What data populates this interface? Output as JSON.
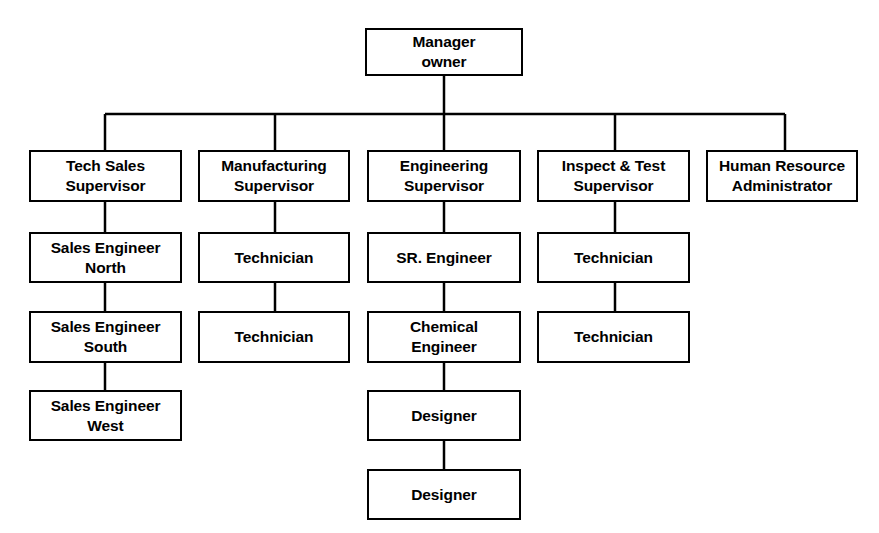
{
  "chart_data": {
    "type": "diagram",
    "diagram_type": "organizational-chart",
    "orientation": "top-down",
    "style": {
      "box_fill": "#ffffff",
      "box_border": "#000000",
      "connector_color": "#000000",
      "background": "#ffffff",
      "border_width_px": 2.5,
      "connector_width_px": 2.5
    },
    "canvas": {
      "width": 879,
      "height": 533
    },
    "bus_bar": {
      "y": 114,
      "x_start": 105,
      "x_end": 785
    },
    "root": {
      "id": "manager-owner",
      "label": "Manager\nowner",
      "box": {
        "x": 365,
        "y": 28,
        "w": 158,
        "h": 48
      }
    },
    "columns": [
      {
        "id": "col-tech-sales",
        "center_x": 105,
        "nodes": [
          {
            "id": "tech-sales-supervisor",
            "label": "Tech Sales\nSupervisor",
            "box": {
              "x": 29,
              "y": 150,
              "w": 153,
              "h": 52
            }
          },
          {
            "id": "sales-engineer-north",
            "label": "Sales Engineer\nNorth",
            "box": {
              "x": 29,
              "y": 232,
              "w": 153,
              "h": 51
            }
          },
          {
            "id": "sales-engineer-south",
            "label": "Sales Engineer\nSouth",
            "box": {
              "x": 29,
              "y": 311,
              "w": 153,
              "h": 52
            }
          },
          {
            "id": "sales-engineer-west",
            "label": "Sales Engineer\nWest",
            "box": {
              "x": 29,
              "y": 390,
              "w": 153,
              "h": 51
            }
          }
        ]
      },
      {
        "id": "col-manufacturing",
        "center_x": 275,
        "nodes": [
          {
            "id": "manufacturing-supervisor",
            "label": "Manufacturing\nSupervisor",
            "box": {
              "x": 198,
              "y": 150,
              "w": 152,
              "h": 52
            }
          },
          {
            "id": "manufacturing-technician-1",
            "label": "Technician",
            "box": {
              "x": 198,
              "y": 232,
              "w": 152,
              "h": 51
            }
          },
          {
            "id": "manufacturing-technician-2",
            "label": "Technician",
            "box": {
              "x": 198,
              "y": 311,
              "w": 152,
              "h": 52
            }
          }
        ]
      },
      {
        "id": "col-engineering",
        "center_x": 444,
        "nodes": [
          {
            "id": "engineering-supervisor",
            "label": "Engineering\nSupervisor",
            "box": {
              "x": 367,
              "y": 150,
              "w": 154,
              "h": 52
            }
          },
          {
            "id": "sr-engineer",
            "label": "SR. Engineer",
            "box": {
              "x": 367,
              "y": 232,
              "w": 154,
              "h": 51
            }
          },
          {
            "id": "chemical-engineer",
            "label": "Chemical\nEngineer",
            "box": {
              "x": 367,
              "y": 311,
              "w": 154,
              "h": 52
            }
          },
          {
            "id": "designer-1",
            "label": "Designer",
            "box": {
              "x": 367,
              "y": 390,
              "w": 154,
              "h": 51
            }
          },
          {
            "id": "designer-2",
            "label": "Designer",
            "box": {
              "x": 367,
              "y": 469,
              "w": 154,
              "h": 51
            }
          }
        ]
      },
      {
        "id": "col-inspect-test",
        "center_x": 615,
        "nodes": [
          {
            "id": "inspect-test-supervisor",
            "label": "Inspect & Test\nSupervisor",
            "box": {
              "x": 537,
              "y": 150,
              "w": 153,
              "h": 52
            }
          },
          {
            "id": "inspect-technician-1",
            "label": "Technician",
            "box": {
              "x": 537,
              "y": 232,
              "w": 153,
              "h": 51
            }
          },
          {
            "id": "inspect-technician-2",
            "label": "Technician",
            "box": {
              "x": 537,
              "y": 311,
              "w": 153,
              "h": 52
            }
          }
        ]
      },
      {
        "id": "col-human-resource",
        "center_x": 785,
        "nodes": [
          {
            "id": "human-resource-administrator",
            "label": "Human Resource\nAdministrator",
            "box": {
              "x": 706,
              "y": 150,
              "w": 152,
              "h": 52
            }
          }
        ]
      }
    ],
    "connectors": [
      {
        "id": "root-stem",
        "x1": 444,
        "y1": 76,
        "x2": 444,
        "y2": 114
      },
      {
        "id": "bus-bar",
        "x1": 105,
        "y1": 114,
        "x2": 785,
        "y2": 114
      },
      {
        "id": "drop-tech-sales",
        "x1": 105,
        "y1": 114,
        "x2": 105,
        "y2": 150
      },
      {
        "id": "drop-manufacturing",
        "x1": 275,
        "y1": 114,
        "x2": 275,
        "y2": 150
      },
      {
        "id": "drop-engineering",
        "x1": 444,
        "y1": 114,
        "x2": 444,
        "y2": 150
      },
      {
        "id": "drop-inspect-test",
        "x1": 615,
        "y1": 114,
        "x2": 615,
        "y2": 150
      },
      {
        "id": "drop-human-resource",
        "x1": 785,
        "y1": 114,
        "x2": 785,
        "y2": 150
      },
      {
        "id": "link-tech-sales-north",
        "x1": 105,
        "y1": 202,
        "x2": 105,
        "y2": 232
      },
      {
        "id": "link-north-south",
        "x1": 105,
        "y1": 283,
        "x2": 105,
        "y2": 311
      },
      {
        "id": "link-south-west",
        "x1": 105,
        "y1": 363,
        "x2": 105,
        "y2": 390
      },
      {
        "id": "link-manufacturing-tech1",
        "x1": 275,
        "y1": 202,
        "x2": 275,
        "y2": 232
      },
      {
        "id": "link-tech1-tech2",
        "x1": 275,
        "y1": 283,
        "x2": 275,
        "y2": 311
      },
      {
        "id": "link-engineering-sr",
        "x1": 444,
        "y1": 202,
        "x2": 444,
        "y2": 232
      },
      {
        "id": "link-sr-chemical",
        "x1": 444,
        "y1": 283,
        "x2": 444,
        "y2": 311
      },
      {
        "id": "link-chemical-designer1",
        "x1": 444,
        "y1": 363,
        "x2": 444,
        "y2": 390
      },
      {
        "id": "link-designer1-designer2",
        "x1": 444,
        "y1": 441,
        "x2": 444,
        "y2": 469
      },
      {
        "id": "link-inspect-tech1",
        "x1": 615,
        "y1": 202,
        "x2": 615,
        "y2": 232
      },
      {
        "id": "link-inspect-tech1-tech2",
        "x1": 615,
        "y1": 283,
        "x2": 615,
        "y2": 311
      }
    ],
    "hierarchy": {
      "Manager owner": [
        {
          "Tech Sales Supervisor": [
            "Sales Engineer North",
            "Sales Engineer South",
            "Sales Engineer West"
          ]
        },
        {
          "Manufacturing Supervisor": [
            "Technician",
            "Technician"
          ]
        },
        {
          "Engineering Supervisor": [
            "SR. Engineer",
            "Chemical Engineer",
            "Designer",
            "Designer"
          ]
        },
        {
          "Inspect & Test Supervisor": [
            "Technician",
            "Technician"
          ]
        },
        {
          "Human Resource Administrator": []
        }
      ]
    },
    "node_count": 19,
    "depth": 6
  }
}
